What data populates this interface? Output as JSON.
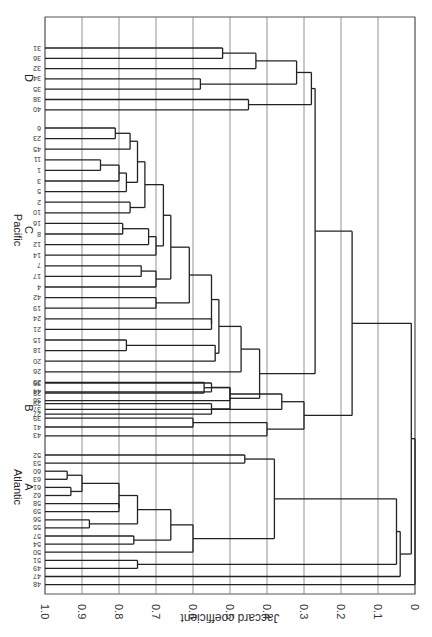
{
  "chart_data": {
    "type": "dendrogram",
    "orientation": "rotated 90 degrees (axis along bottom, leaves along left, text upside-down)",
    "xlabel": "Jaccard coefficient",
    "axis": {
      "ticks": [
        "1.0",
        "0.9",
        "0.8",
        "0.7",
        "0.6",
        "0.5",
        "0.4",
        "0.3",
        "0.2",
        "0.1",
        "0"
      ],
      "range": [
        1.0,
        0.0
      ],
      "grid": true
    },
    "groups": [
      {
        "name": "D",
        "region": "",
        "leaves": [
          "31",
          "36",
          "32",
          "34",
          "35",
          "38",
          "40"
        ]
      },
      {
        "name": "C",
        "region": "Pacific",
        "leaves": [
          "6",
          "23",
          "45",
          "11",
          "1",
          "3",
          "5",
          "2",
          "10",
          "16",
          "8",
          "12",
          "14",
          "7",
          "17",
          "4",
          "42",
          "19",
          "24",
          "21",
          "15",
          "18",
          "20",
          "26",
          "25",
          "28",
          "29",
          "27"
        ]
      },
      {
        "name": "B",
        "region": "",
        "leaves": [
          "30",
          "44",
          "36",
          "37",
          "39",
          "41",
          "43"
        ]
      },
      {
        "name": "A",
        "region": "Atlantic",
        "leaves": [
          "52",
          "53",
          "60",
          "63",
          "61",
          "62",
          "58",
          "59",
          "56",
          "55",
          "57",
          "54",
          "50",
          "51",
          "49",
          "47",
          "48"
        ]
      }
    ],
    "major_merges": [
      {
        "clusters": [
          "D internal"
        ],
        "similarity": 0.28
      },
      {
        "clusters": [
          "C internal"
        ],
        "similarity": 0.42
      },
      {
        "clusters": [
          "C",
          "D"
        ],
        "similarity": 0.27
      },
      {
        "clusters": [
          "B internal"
        ],
        "similarity": 0.3
      },
      {
        "clusters": [
          "B",
          "C+D"
        ],
        "similarity": 0.17
      },
      {
        "clusters": [
          "A internal"
        ],
        "similarity": 0.38
      },
      {
        "clusters": [
          "A",
          "49"
        ],
        "similarity": 0.05
      },
      {
        "clusters": [
          "A",
          "B+C+D"
        ],
        "similarity": 0.04
      },
      {
        "clusters": [
          "47",
          "all"
        ],
        "similarity": 0.01
      },
      {
        "clusters": [
          "48",
          "all"
        ],
        "similarity": 0.0
      }
    ]
  },
  "labels": {
    "xlabel": "Jaccard coefficient",
    "group_D": "D",
    "group_C_region": "Pacific",
    "group_C": "C",
    "group_B": "B",
    "group_A_region": "Atlantic",
    "group_A": "A"
  }
}
